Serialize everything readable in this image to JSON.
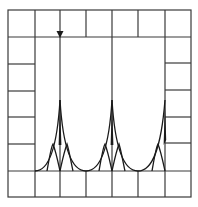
{
  "diagram": {
    "colors": {
      "background": "#ffffff",
      "grid": "#3a3a3a",
      "curves": "#1a1a1a"
    },
    "frame": {
      "x0": 8,
      "y0": 10,
      "x1": 191,
      "y1": 197
    },
    "column_lines_x": [
      8,
      35,
      60,
      86,
      112,
      138,
      165,
      191
    ],
    "top_row": {
      "y0": 10,
      "y1": 37
    },
    "bottom_row": {
      "y0": 171,
      "y1": 197
    },
    "left_column_rows_y": [
      64,
      91,
      117,
      144
    ],
    "right_column_rows_y": [
      63,
      90,
      117,
      143
    ],
    "baseline_y": 171,
    "cusps": [
      {
        "x": 60,
        "tip_y": 100
      },
      {
        "x": 112,
        "tip_y": 100
      },
      {
        "x": 165,
        "tip_y": 100
      }
    ],
    "arrow": {
      "x": 60,
      "tip_y": 37,
      "direction": "down"
    }
  }
}
